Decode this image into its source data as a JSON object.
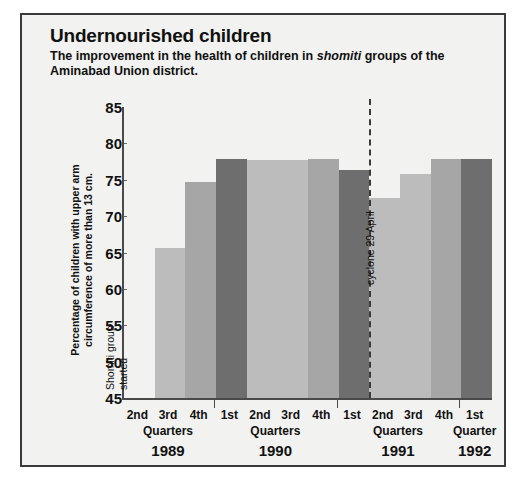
{
  "header": {
    "title": "Undernourished children",
    "subtitle_part1": "The improvement in the health of children in ",
    "subtitle_italic": "shomiti",
    "subtitle_part2": " groups of the Aminabad Union district."
  },
  "annotations": {
    "shomiti_line1": "Shomiti group",
    "shomiti_line2": "started",
    "cyclone": "cyclone 29 April"
  },
  "colors": {
    "background": "#f2f2f0",
    "frame": "#3a3a3a",
    "axis": "#4a4a4a",
    "bar_light": "#bcbcbc",
    "bar_medium": "#a6a6a6",
    "bar_dark": "#6e6e6e",
    "text": "#111111"
  },
  "chart_data": {
    "type": "bar",
    "title": "Undernourished children",
    "subtitle": "The improvement in the health of children in shomiti groups of the Aminabad Union district.",
    "xlabel": "",
    "ylabel": "Percentage of children with upper arm circumference of more than 13 cm.",
    "ylim": [
      45,
      85
    ],
    "yticks": [
      45,
      50,
      55,
      60,
      65,
      70,
      75,
      80,
      85
    ],
    "grid": false,
    "legend": "none",
    "categories": [
      "1989 2nd",
      "1989 3rd",
      "1989 4th",
      "1990 1st",
      "1990 2nd",
      "1990 3rd",
      "1990 4th",
      "1991 1st",
      "1991 2nd",
      "1991 3rd",
      "1991 4th",
      "1992 1st"
    ],
    "values": [
      45.0,
      65.6,
      74.7,
      77.8,
      77.7,
      77.7,
      77.8,
      76.4,
      72.5,
      75.8,
      77.8,
      77.8
    ],
    "bar_shades": [
      "bar_light",
      "bar_light",
      "bar_medium",
      "bar_dark",
      "bar_light",
      "bar_light",
      "bar_medium",
      "bar_dark",
      "bar_light",
      "bar_light",
      "bar_medium",
      "bar_dark"
    ],
    "annotations": [
      {
        "text": "Shomiti group started",
        "x_category": "1989 2nd",
        "orientation": "vertical"
      },
      {
        "text": "cyclone 29 April",
        "x_category": "between 1991 1st and 1991 2nd",
        "orientation": "vertical",
        "marker": "dashed-vertical-line"
      }
    ]
  },
  "axis": {
    "quarter_labels": [
      "2nd",
      "3rd",
      "4th",
      "1st",
      "2nd",
      "3rd",
      "4th",
      "1st",
      "2nd",
      "3rd",
      "4th",
      "1st"
    ],
    "groups": [
      {
        "word": "Quarters",
        "year": "1989"
      },
      {
        "word": "Quarters",
        "year": "1990"
      },
      {
        "word": "Quarters",
        "year": "1991"
      },
      {
        "word": "Quarter",
        "year": "1992"
      }
    ]
  }
}
